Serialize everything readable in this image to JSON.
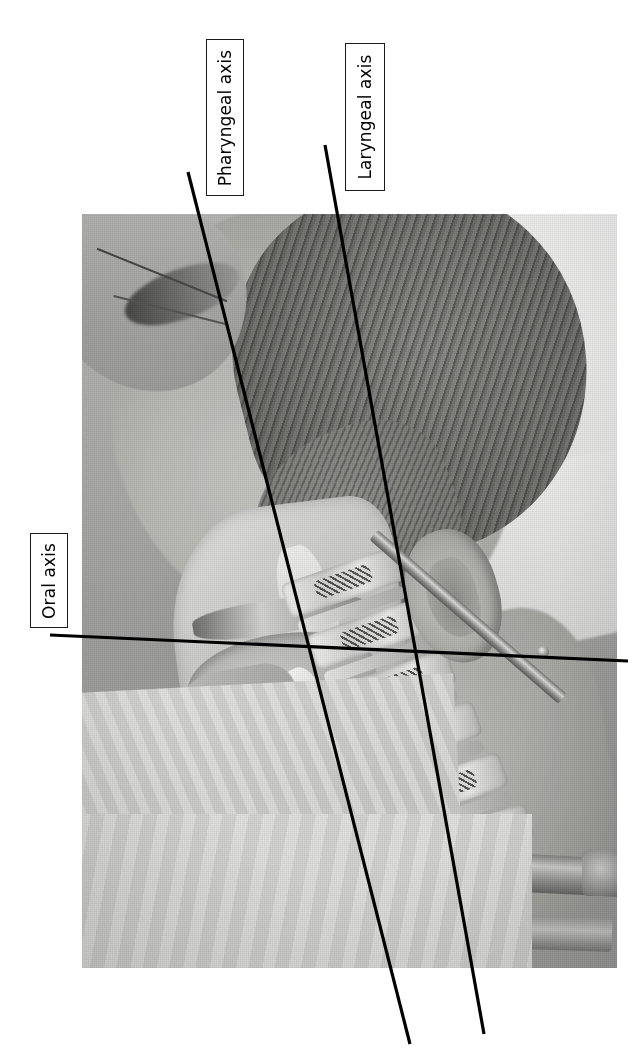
{
  "figure": {
    "background_color": "#ffffff",
    "line_color": "#000000",
    "label_border_color": "#1a1a1a",
    "label_fill_color": "#ffffff"
  },
  "photo": {
    "name": "manikin-head-neck-sagittal-photo",
    "x": 82,
    "y": 214,
    "width": 535,
    "height": 754,
    "tone": "grayscale",
    "regions": [
      {
        "name": "gloved-hand-and-instrument",
        "position": "upper-left"
      },
      {
        "name": "hair",
        "position": "upper-center"
      },
      {
        "name": "ear",
        "position": "center-right"
      },
      {
        "name": "white-drape-cloth",
        "position": "upper-right"
      },
      {
        "name": "sagittal-cutaway-oral-cavity",
        "position": "center-left"
      },
      {
        "name": "tongue",
        "position": "center-left"
      },
      {
        "name": "hard-palate",
        "position": "center-left"
      },
      {
        "name": "epiglottis",
        "position": "center"
      },
      {
        "name": "cervical-vertebrae",
        "position": "center-right"
      },
      {
        "name": "metal-support-rod",
        "position": "right"
      },
      {
        "name": "mounting-hardware",
        "position": "bottom-right"
      },
      {
        "name": "surgical-drape-sheet",
        "position": "bottom-left"
      }
    ]
  },
  "axes": [
    {
      "id": "oral",
      "label": "Oral axis",
      "label_rotation_deg": -90,
      "line": {
        "x1": 50,
        "y1": 635,
        "x2": 628,
        "y2": 661
      },
      "label_box": {
        "x": 30,
        "y": 533,
        "width": 38,
        "height": 95
      }
    },
    {
      "id": "pharyngeal",
      "label": "Pharyngeal axis",
      "label_rotation_deg": -90,
      "line": {
        "x1": 188,
        "y1": 172,
        "x2": 410,
        "y2": 1044
      },
      "label_box": {
        "x": 206,
        "y": 39,
        "width": 38,
        "height": 157
      }
    },
    {
      "id": "laryngeal",
      "label": "Laryngeal axis",
      "label_rotation_deg": -90,
      "line": {
        "x1": 325,
        "y1": 145,
        "x2": 484,
        "y2": 1034
      },
      "label_box": {
        "x": 345,
        "y": 43,
        "width": 40,
        "height": 148
      }
    }
  ],
  "vertebrae": {
    "count": 6,
    "label": "cervical-vertebral-bodies"
  }
}
